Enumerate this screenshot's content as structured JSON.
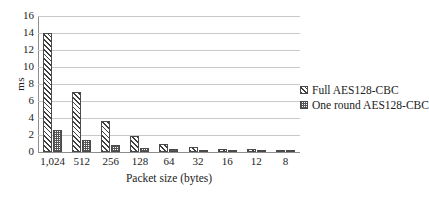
{
  "chart_data": {
    "type": "bar",
    "title": "",
    "xlabel": "Packet size (bytes)",
    "ylabel": "ms",
    "categories": [
      "1,024",
      "512",
      "256",
      "128",
      "64",
      "32",
      "16",
      "12",
      "8"
    ],
    "series": [
      {
        "name": "Full AES128-CBC",
        "values": [
          14.0,
          7.1,
          3.6,
          1.9,
          1.0,
          0.55,
          0.35,
          0.3,
          0.25
        ]
      },
      {
        "name": "One round AES128-CBC",
        "values": [
          2.6,
          1.4,
          0.8,
          0.5,
          0.3,
          0.2,
          0.15,
          0.12,
          0.1
        ]
      }
    ],
    "ylim": [
      0,
      16
    ],
    "yticks": [
      "0",
      "2",
      "4",
      "6",
      "8",
      "10",
      "12",
      "14",
      "16"
    ],
    "ytick_values": [
      0,
      2,
      4,
      6,
      8,
      10,
      12,
      14,
      16
    ],
    "grid": "horizontal",
    "legend_position": "right"
  },
  "colors": {
    "gridline": "#c9c9c9",
    "axis": "#8d8d8d",
    "bar_outline": "#4a4a4a",
    "text": "#222222",
    "background": "#ffffff"
  }
}
